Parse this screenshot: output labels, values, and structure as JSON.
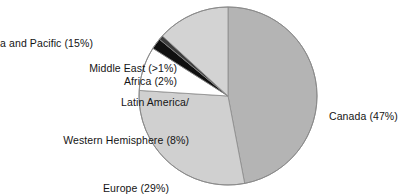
{
  "chart_data": {
    "type": "pie",
    "title": "",
    "subtitle": "",
    "xlabel": "",
    "ylabel": "",
    "legend_position": "none",
    "grid": false,
    "start_angle_deg": 0,
    "direction": "clockwise",
    "center": {
      "x": 228,
      "y": 96
    },
    "radius": 89,
    "categories": [
      "Canada",
      "Europe",
      "Latin America/Western Hemisphere",
      "Africa",
      "Middle East",
      "Asia and Pacific"
    ],
    "values": [
      47,
      29,
      8,
      2,
      0.8,
      15
    ],
    "value_unit": "percent",
    "slices": [
      {
        "name": "Canada",
        "label_text": "Canada (47%)",
        "percent": 47,
        "percent_text": "47%",
        "color": "#b4b4b4",
        "start_deg": 0,
        "end_deg": 169.2
      },
      {
        "name": "Europe",
        "label_text": "Europe (29%)",
        "percent": 29,
        "percent_text": "29%",
        "color": "#d0d0d0",
        "start_deg": 169.2,
        "end_deg": 273.6
      },
      {
        "name": "Latin America/Western Hemisphere",
        "label_line_1": "Latin America/",
        "label_line_2": "Western Hemisphere (8%)",
        "percent": 8,
        "percent_text": "8%",
        "color": "#ffffff",
        "start_deg": 273.6,
        "end_deg": 302.4
      },
      {
        "name": "Africa",
        "label_text": "Africa (2%)",
        "percent": 2,
        "percent_text": "2%",
        "color": "#101010",
        "start_deg": 302.4,
        "end_deg": 309.6
      },
      {
        "name": "Middle East",
        "label_text": "Middle East (>1%)",
        "percent": 0.8,
        "percent_text": ">1%",
        "color": "#3d3d3d",
        "start_deg": 309.6,
        "end_deg": 312.5
      },
      {
        "name": "Asia and Pacific",
        "label_text": "Asia and Pacific (15%)",
        "percent": 15,
        "percent_text": "15%",
        "color": "#d3d3d3",
        "start_deg": 312.5,
        "end_deg": 360
      }
    ],
    "outline_color": "#8a8a8a",
    "background": "#ffffff"
  },
  "labels": {
    "asia_pacific": "Asia and Pacific (15%)",
    "middle_east": "Middle East (>1%)",
    "africa": "Africa (2%)",
    "latin_america_line1": "Latin America/",
    "latin_america_line2": "Western Hemisphere (8%)",
    "europe": "Europe (29%)",
    "canada": "Canada (47%)"
  }
}
